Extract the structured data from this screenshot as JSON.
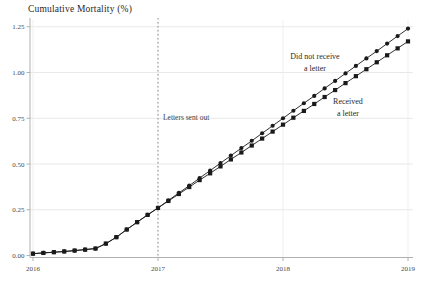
{
  "figure": {
    "title": "Cumulative Mortality (%)",
    "labels": {
      "letters_sent": "Letters sent out",
      "no_letter": [
        "Did not receive",
        "a letter"
      ],
      "received": [
        "Received",
        "a letter"
      ]
    }
  },
  "chart_data": {
    "type": "line",
    "title": "Cumulative Mortality (%)",
    "xlabel": "",
    "ylabel": "Cumulative Mortality (%)",
    "xlim": [
      2016,
      2019.05
    ],
    "ylim": [
      0,
      1.25
    ],
    "grid": true,
    "x_ticks": [
      2016,
      2017,
      2018,
      2019
    ],
    "x_tick_labels": [
      "2016",
      "2017",
      "2018",
      "2019"
    ],
    "y_ticks": [
      0,
      0.25,
      0.5,
      0.75,
      1.0,
      1.25
    ],
    "y_tick_labels": [
      "0.00",
      "0.25",
      "0.50",
      "0.75",
      "1.00",
      "1.25"
    ],
    "vline": {
      "x": 2017,
      "style": "dotted",
      "label": "Letters sent out"
    },
    "x": [
      2016.0,
      2016.083,
      2016.167,
      2016.25,
      2016.333,
      2016.417,
      2016.5,
      2016.583,
      2016.667,
      2016.75,
      2016.833,
      2016.917,
      2017.0,
      2017.083,
      2017.167,
      2017.25,
      2017.333,
      2017.417,
      2017.5,
      2017.583,
      2017.667,
      2017.75,
      2017.833,
      2017.917,
      2018.0,
      2018.083,
      2018.167,
      2018.25,
      2018.333,
      2018.417,
      2018.5,
      2018.583,
      2018.667,
      2018.75,
      2018.833,
      2018.917,
      2019.0
    ],
    "series": [
      {
        "name": "Did not receive a letter",
        "marker": "circle",
        "color": "#1a1a1a",
        "values": [
          0.01,
          0.014,
          0.018,
          0.022,
          0.027,
          0.032,
          0.038,
          0.065,
          0.1,
          0.142,
          0.182,
          0.222,
          0.26,
          0.301,
          0.342,
          0.382,
          0.423,
          0.464,
          0.505,
          0.546,
          0.587,
          0.627,
          0.668,
          0.709,
          0.75,
          0.791,
          0.832,
          0.872,
          0.913,
          0.954,
          0.995,
          1.036,
          1.077,
          1.117,
          1.158,
          1.199,
          1.24
        ]
      },
      {
        "name": "Received a letter",
        "marker": "square",
        "color": "#1a1a1a",
        "values": [
          0.01,
          0.014,
          0.018,
          0.022,
          0.027,
          0.032,
          0.038,
          0.065,
          0.1,
          0.142,
          0.182,
          0.222,
          0.26,
          0.298,
          0.336,
          0.374,
          0.412,
          0.449,
          0.487,
          0.525,
          0.563,
          0.601,
          0.639,
          0.677,
          0.715,
          0.753,
          0.79,
          0.828,
          0.866,
          0.904,
          0.942,
          0.98,
          1.018,
          1.056,
          1.094,
          1.132,
          1.17
        ]
      }
    ],
    "colors": {
      "line": "#1a1a1a",
      "gridline_h": "#e2e2e2",
      "gridline_v": "#ebebeb",
      "axis": "#b0b0b0",
      "tick_text": "#4a4a4a",
      "vline": "#8a8a8a",
      "background": "#ffffff"
    }
  }
}
